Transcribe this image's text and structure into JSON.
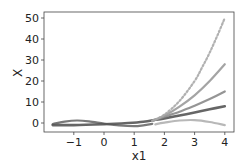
{
  "chart_data": {
    "type": "line",
    "title": "",
    "xlabel": "x1",
    "ylabel": "X",
    "xlim": [
      -1.85,
      4.3
    ],
    "ylim": [
      -4,
      53
    ],
    "xticks": [
      -1,
      0,
      1,
      2,
      3,
      4
    ],
    "xtick_labels": [
      "−1",
      "0",
      "1",
      "2",
      "3",
      "4"
    ],
    "yticks": [
      0,
      10,
      20,
      30,
      40,
      50
    ],
    "ytick_labels": [
      "0",
      "10",
      "20",
      "30",
      "40",
      "50"
    ],
    "grid": false,
    "legend": null,
    "series": [
      {
        "name": "feature-1",
        "color": "#6a6a6a",
        "width": 2.2,
        "dotted": false,
        "x": [
          -1.7,
          -1.3,
          -0.9,
          -0.5,
          0,
          0.5,
          1.0,
          1.3,
          1.6
        ],
        "y": [
          -0.5,
          0.6,
          1.2,
          0.8,
          -0.3,
          -1.2,
          -1.5,
          -1.1,
          -0.4
        ]
      },
      {
        "name": "feature-2",
        "color": "#555555",
        "width": 2.6,
        "dotted": false,
        "x": [
          -1.7,
          -1.0,
          0,
          0.8,
          1.3,
          1.7,
          2.0,
          2.5,
          3.0,
          3.5,
          4.0
        ],
        "y": [
          -1.0,
          -1.0,
          -0.6,
          0.0,
          0.6,
          1.5,
          2.2,
          3.6,
          5.0,
          6.5,
          8.0
        ]
      },
      {
        "name": "feature-3",
        "color": "#8a8a8a",
        "width": 2.2,
        "dotted": false,
        "x": [
          1.6,
          2.0,
          2.5,
          3.0,
          3.5,
          4.0
        ],
        "y": [
          1.0,
          3.0,
          5.4,
          8.2,
          11.4,
          15.0
        ]
      },
      {
        "name": "feature-4",
        "color": "#9a9a9a",
        "width": 2.2,
        "dotted": false,
        "x": [
          1.6,
          2.0,
          2.5,
          3.0,
          3.5,
          4.0
        ],
        "y": [
          1.0,
          3.5,
          7.8,
          13.2,
          20.0,
          28.0
        ]
      },
      {
        "name": "feature-5",
        "color": "#a8a8a8",
        "width": 2.2,
        "dotted": true,
        "x": [
          1.6,
          2.0,
          2.5,
          3.0,
          3.25,
          3.5,
          3.75,
          4.0
        ],
        "y": [
          1.0,
          4.0,
          10.5,
          20.0,
          26.5,
          33.5,
          41.5,
          50.0
        ]
      },
      {
        "name": "feature-6",
        "color": "#b0b0b0",
        "width": 2.2,
        "dotted": false,
        "x": [
          1.7,
          2.0,
          2.5,
          3.0,
          3.5,
          4.0
        ],
        "y": [
          -0.6,
          0.2,
          1.2,
          1.4,
          0.5,
          -1.0
        ]
      }
    ]
  }
}
